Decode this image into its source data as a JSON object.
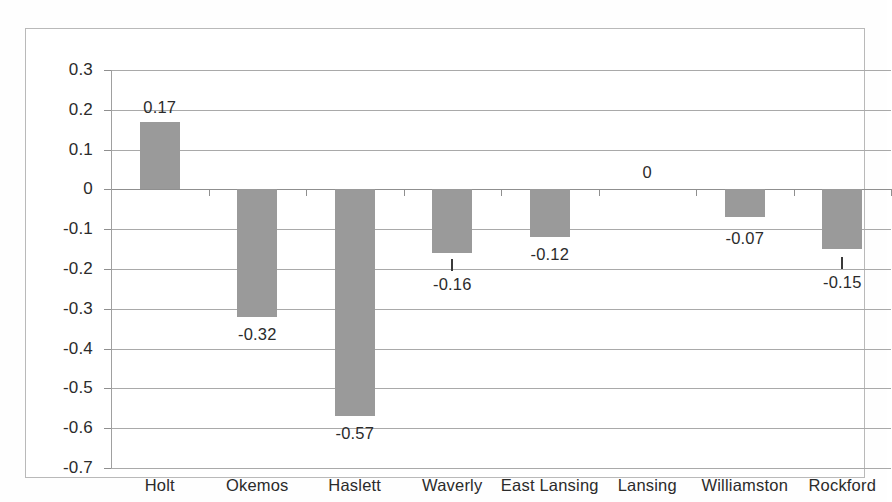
{
  "chart_data": {
    "type": "bar",
    "title": "",
    "subtitle": "",
    "xlabel": "",
    "ylabel": "",
    "categories": [
      "Holt",
      "Okemos",
      "Haslett",
      "Waverly",
      "East Lansing",
      "Lansing",
      "Williamston",
      "Rockford"
    ],
    "values": [
      0.17,
      -0.32,
      -0.57,
      -0.16,
      -0.12,
      0,
      -0.07,
      -0.15
    ],
    "data_labels": [
      "0.17",
      "-0.32",
      "-0.57",
      "-0.16",
      "-0.12",
      "0",
      "-0.07",
      "-0.15"
    ],
    "ylim": [
      -0.7,
      0.3
    ],
    "ytick_values": [
      0.3,
      0.2,
      0.1,
      0,
      -0.1,
      -0.2,
      -0.3,
      -0.4,
      -0.5,
      -0.6,
      -0.7
    ],
    "ytick_labels": [
      "0.3",
      "0.2",
      "0.1",
      "0",
      "-0.1",
      "-0.2",
      "-0.3",
      "-0.4",
      "-0.5",
      "-0.6",
      "-0.7"
    ],
    "grid": true,
    "legend": false,
    "legend_position": "none",
    "series": [
      {
        "name": "",
        "values": [
          0.17,
          -0.32,
          -0.57,
          -0.16,
          -0.12,
          0,
          -0.07,
          -0.15
        ]
      }
    ],
    "colors": {
      "bar_fill": "#9a9a9a",
      "gridline": "#a9a9a9",
      "axis": "#8f8f8f",
      "frame": "#b9b9b9",
      "text": "#2b2b2b",
      "background": "#ffffff"
    }
  }
}
